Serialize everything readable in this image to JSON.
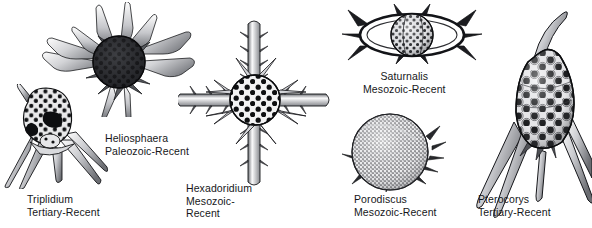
{
  "figure": {
    "background_color": "#ffffff",
    "ink_color": "#16171a",
    "width": 592,
    "height": 228
  },
  "specimens": [
    {
      "id": "heliosphaera",
      "genus": "Heliosphaera",
      "range": "Paleozoic-Recent",
      "form": "spherical-porous-test-with-radiating-blade-spines",
      "caption_align": "left"
    },
    {
      "id": "triplidium",
      "genus": "Triplidium",
      "range": "Tertiary-Recent",
      "form": "helmet-shaped-porous-test-with-three-diverging-feet",
      "caption_align": "left"
    },
    {
      "id": "hexadoridium",
      "genus": "Hexadoridium",
      "range": "Mesozoic-",
      "range_line2": "Recent",
      "form": "porous-sphere-with-four-barbed-cruciform-spines",
      "caption_align": "left"
    },
    {
      "id": "saturnalis",
      "genus": "Saturnalis",
      "range": "Mesozoic-Recent",
      "form": "porous-sphere-inside-spiny-elliptical-girdle-ring",
      "caption_align": "center"
    },
    {
      "id": "porodiscus",
      "genus": "Porodiscus",
      "range": "Mesozoic-Recent",
      "form": "stippled-circular-disc-with-marginal-spinelets",
      "caption_align": "left"
    },
    {
      "id": "pterocorys",
      "genus": "Pterocorys",
      "range": "Tertiary-Recent",
      "form": "conical-latticed-test-with-apical-horn-and-long-feet",
      "caption_align": "left"
    }
  ]
}
